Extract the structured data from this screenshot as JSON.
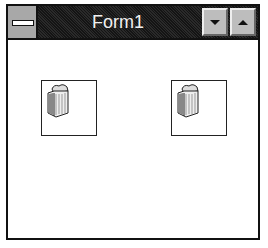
{
  "window": {
    "title": "Form1",
    "controls": {
      "system_menu_icon": "system-menu-icon",
      "minimize_icon": "minimize-arrow-icon",
      "maximize_icon": "maximize-arrow-icon"
    }
  },
  "client": {
    "icons": [
      {
        "name": "file-folder-stack-icon"
      },
      {
        "name": "file-folder-stack-icon"
      }
    ]
  }
}
